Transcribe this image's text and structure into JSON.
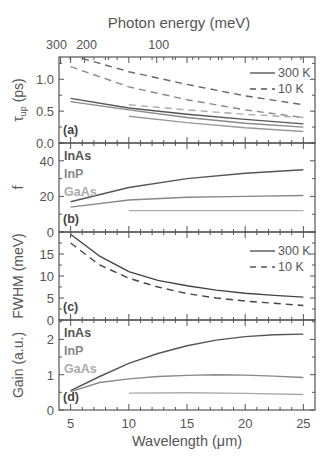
{
  "chart_data": {
    "type": "line",
    "top_axis": {
      "label": "Photon energy (meV)",
      "ticks": [
        "300",
        "200",
        "100"
      ]
    },
    "xlabel": "Wavelength (μm)",
    "xlim": [
      4,
      26
    ],
    "xticks": [
      5,
      10,
      15,
      20,
      25
    ],
    "materials": [
      {
        "name": "InAs",
        "color": "#555555"
      },
      {
        "name": "InP",
        "color": "#888888"
      },
      {
        "name": "GaAs",
        "color": "#aaaaaa"
      }
    ],
    "panels": [
      {
        "id": "a",
        "label": "(a)",
        "ylabel": "τ_up (ps)",
        "ylim": [
          0,
          1.35
        ],
        "yticks": [
          0.0,
          0.5,
          1.0
        ],
        "yticklabels": [
          "0.0",
          "0.5",
          "1.0"
        ],
        "legend": [
          {
            "label": "300 K",
            "style": "solid"
          },
          {
            "label": "10 K",
            "style": "dashed"
          }
        ],
        "series": [
          {
            "name": "InAs 10 K",
            "style": "dashed",
            "color": "#666666",
            "x": [
              5,
              10,
              15,
              20,
              25
            ],
            "values": [
              1.38,
              1.12,
              0.92,
              0.74,
              0.6
            ]
          },
          {
            "name": "InP 10 K",
            "style": "dashed",
            "color": "#888888",
            "x": [
              5,
              10,
              15,
              20,
              25
            ],
            "values": [
              1.2,
              0.88,
              0.68,
              0.52,
              0.4
            ]
          },
          {
            "name": "GaAs 10 K",
            "style": "dashed",
            "color": "#aaaaaa",
            "x": [
              10,
              15,
              20,
              25
            ],
            "values": [
              0.6,
              0.52,
              0.45,
              0.4
            ]
          },
          {
            "name": "InAs 300 K",
            "style": "solid",
            "color": "#555555",
            "x": [
              5,
              10,
              15,
              20,
              25
            ],
            "values": [
              0.7,
              0.55,
              0.45,
              0.37,
              0.3
            ]
          },
          {
            "name": "InP 300 K",
            "style": "solid",
            "color": "#888888",
            "x": [
              5,
              10,
              15,
              20,
              25
            ],
            "values": [
              0.65,
              0.52,
              0.4,
              0.31,
              0.25
            ]
          },
          {
            "name": "GaAs 300 K",
            "style": "solid",
            "color": "#999999",
            "x": [
              10,
              15,
              20,
              25
            ],
            "values": [
              0.42,
              0.32,
              0.24,
              0.18
            ]
          }
        ]
      },
      {
        "id": "b",
        "label": "(b)",
        "ylabel": "f",
        "ylim": [
          0,
          50
        ],
        "yticks": [
          0,
          20,
          40
        ],
        "yticklabels": [
          "0",
          "20",
          "40"
        ],
        "legend_text": [
          "InAs",
          "InP",
          "GaAs"
        ],
        "series": [
          {
            "name": "InAs",
            "style": "solid",
            "color": "#555555",
            "x": [
              5,
              10,
              15,
              20,
              25
            ],
            "values": [
              17,
              25,
              30,
              33,
              35
            ]
          },
          {
            "name": "InP",
            "style": "solid",
            "color": "#888888",
            "x": [
              5,
              10,
              15,
              20,
              25
            ],
            "values": [
              14,
              18,
              19.5,
              20,
              20.5
            ]
          },
          {
            "name": "GaAs",
            "style": "solid",
            "color": "#aaaaaa",
            "x": [
              10,
              15,
              20,
              25
            ],
            "values": [
              12,
              12,
              12,
              12
            ]
          }
        ]
      },
      {
        "id": "c",
        "label": "(c)",
        "ylabel": "FWHM (meV)",
        "ylim": [
          0,
          20
        ],
        "yticks": [
          0,
          5,
          10,
          15
        ],
        "yticklabels": [
          "0",
          "5",
          "10",
          "15"
        ],
        "legend": [
          {
            "label": "300 K",
            "style": "solid"
          },
          {
            "label": "10 K",
            "style": "dashed"
          }
        ],
        "series": [
          {
            "name": "300 K",
            "style": "solid",
            "color": "#444444",
            "x": [
              5,
              7.5,
              10,
              12.5,
              15,
              17.5,
              20,
              22.5,
              25
            ],
            "values": [
              19.5,
              14.5,
              11,
              9,
              7.8,
              6.8,
              6.1,
              5.6,
              5.2
            ]
          },
          {
            "name": "10 K",
            "style": "dashed",
            "color": "#444444",
            "x": [
              5,
              7.5,
              10,
              12.5,
              15,
              17.5,
              20,
              22.5,
              25
            ],
            "values": [
              17.5,
              12.5,
              9.5,
              7.5,
              6,
              5,
              4.3,
              3.8,
              3.3
            ]
          }
        ]
      },
      {
        "id": "d",
        "label": "(d)",
        "ylabel": "Gain (a.u.)",
        "ylim": [
          0,
          2.55
        ],
        "yticks": [
          0,
          1,
          2
        ],
        "yticklabels": [
          "0",
          "1",
          "2"
        ],
        "legend_text": [
          "InAs",
          "InP",
          "GaAs"
        ],
        "series": [
          {
            "name": "InAs",
            "style": "solid",
            "color": "#555555",
            "x": [
              5,
              7.5,
              10,
              12.5,
              15,
              17.5,
              20,
              22.5,
              25
            ],
            "values": [
              0.55,
              0.95,
              1.32,
              1.6,
              1.82,
              1.98,
              2.08,
              2.13,
              2.15
            ]
          },
          {
            "name": "InP",
            "style": "solid",
            "color": "#888888",
            "x": [
              5,
              7.5,
              10,
              12.5,
              15,
              17.5,
              20,
              22.5,
              25
            ],
            "values": [
              0.52,
              0.78,
              0.88,
              0.95,
              0.98,
              1.0,
              0.99,
              0.96,
              0.92
            ]
          },
          {
            "name": "GaAs",
            "style": "solid",
            "color": "#aaaaaa",
            "x": [
              10,
              15,
              20,
              25
            ],
            "values": [
              0.48,
              0.49,
              0.47,
              0.44
            ]
          }
        ]
      }
    ]
  }
}
